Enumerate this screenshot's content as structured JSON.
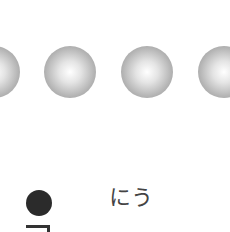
{
  "spheres": [
    {
      "id": "sphere-1",
      "left": -32,
      "top": 46
    },
    {
      "id": "sphere-2",
      "left": 44,
      "top": 46
    },
    {
      "id": "sphere-3",
      "left": 121,
      "top": 46
    },
    {
      "id": "sphere-4",
      "left": 198,
      "top": 46
    }
  ],
  "vertical_text": "うに",
  "colors": {
    "background": "#ffffff",
    "bullet": "#2b2b2b",
    "text": "#444444"
  }
}
